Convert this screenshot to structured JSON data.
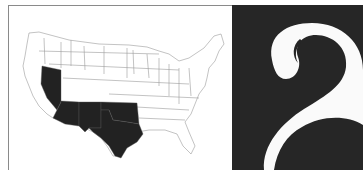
{
  "map": {
    "title": "United States map",
    "highlighted_states": [
      "Nevada",
      "Arizona",
      "New Mexico",
      "Oklahoma",
      "Texas"
    ],
    "highlight_color": "#222222",
    "base_color": "#ffffff",
    "border_color": "#9a9a9a"
  },
  "chapter": {
    "numeral": "2",
    "panel_color": "#262626",
    "numeral_color": "#fafafa"
  }
}
